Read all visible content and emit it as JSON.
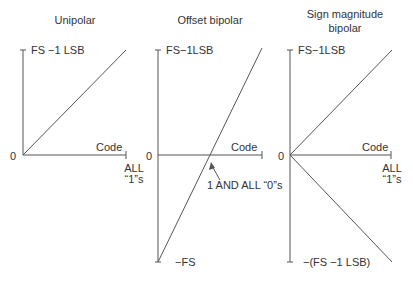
{
  "panels": [
    {
      "title": "Unipolar",
      "top_label": "FS −1 LSB",
      "origin_label": "0",
      "axis_label": "Code",
      "end_label_line1": "ALL",
      "end_label_line2": "“1”s"
    },
    {
      "title": "Offset bipolar",
      "top_label": "FS−1LSB",
      "origin_label": "0",
      "axis_label": "Code",
      "bottom_label": "−FS",
      "annotation": "1 AND ALL “0”s"
    },
    {
      "title_line1": "Sign magnitude",
      "title_line2": "bipolar",
      "top_label": "FS−1LSB",
      "origin_label": "0",
      "axis_label": "Code",
      "end_label_line1": "ALL",
      "end_label_line2": "“1”s",
      "bottom_label": "−(FS −1 LSB)"
    }
  ],
  "colors": {
    "line": "#555555",
    "text": "#333333"
  }
}
